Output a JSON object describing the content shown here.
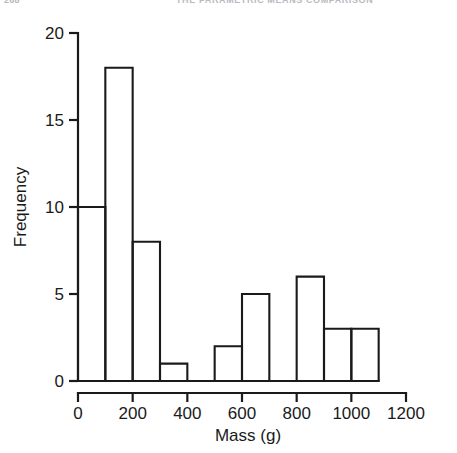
{
  "page": {
    "folio": "268",
    "running_head": "THE PARAMETRIC MEANS COMPARISON"
  },
  "chart_data": {
    "type": "bar",
    "subtype": "histogram",
    "title": "",
    "xlabel": "Mass (g)",
    "ylabel": "Frequency",
    "xlim": [
      0,
      1200
    ],
    "ylim": [
      0,
      20
    ],
    "xticks": [
      0,
      200,
      400,
      600,
      800,
      1000,
      1200
    ],
    "xtick_labels": [
      "0",
      "200",
      "400",
      "600",
      "800",
      "1000",
      "1200"
    ],
    "yticks": [
      0,
      5,
      10,
      15,
      20
    ],
    "ytick_labels": [
      "0",
      "5",
      "10",
      "15",
      "20"
    ],
    "grid": false,
    "legend": false,
    "bin_width": 100,
    "bin_edges": [
      0,
      100,
      200,
      300,
      400,
      500,
      600,
      700,
      800,
      900,
      1000,
      1100
    ],
    "categories": [
      "0-100",
      "100-200",
      "200-300",
      "300-400",
      "400-500",
      "500-600",
      "600-700",
      "700-800",
      "800-900",
      "900-1000",
      "1000-1100"
    ],
    "values": [
      10,
      18,
      8,
      1,
      0,
      2,
      5,
      0,
      6,
      3,
      3
    ],
    "bar_style": {
      "fill": "none",
      "stroke": "#1a1a1a",
      "stroke_width": 2.1
    }
  }
}
